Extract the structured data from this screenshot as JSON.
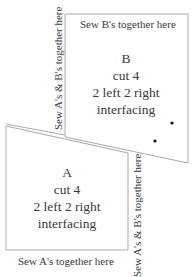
{
  "pieces": {
    "b": {
      "letter": "B",
      "cut": "cut 4",
      "orientation": "2 left 2 right",
      "material": "interfacing",
      "top_label": "Sew B's together here",
      "side_label": "Sew A's & B's together here"
    },
    "a": {
      "letter": "A",
      "cut": "cut 4",
      "orientation": "2 left 2 right",
      "material": "interfacing",
      "bottom_label": "Sew A's together here",
      "side_label": "Sew A's & B's together here"
    }
  },
  "colors": {
    "outline": "#aaaaaa",
    "text": "#3a3a3a",
    "dot": "#111111"
  }
}
